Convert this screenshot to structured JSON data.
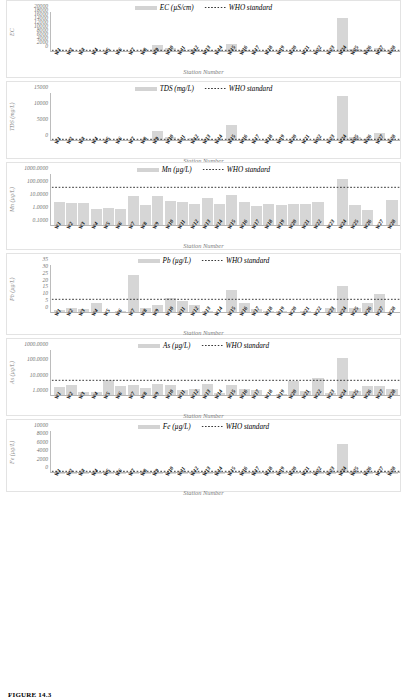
{
  "figure": {
    "caption": "FIGURE 14.3",
    "x_axis_title": "Station Number",
    "stations": [
      "W1",
      "W2",
      "W3",
      "W4",
      "W5",
      "W6",
      "W7",
      "W8",
      "W9",
      "W10",
      "W11",
      "W12",
      "W13",
      "W14",
      "W15",
      "W16",
      "W17",
      "W18",
      "W19",
      "W20",
      "W21",
      "W22",
      "W23",
      "W24",
      "W25",
      "W26",
      "W27",
      "W28"
    ],
    "who_legend_label": "WHO standard",
    "colors": {
      "bar": "#d6d6d6",
      "who_line": "#3b3b3b",
      "axis": "#bcbcbc",
      "label": "#6f6f6f"
    }
  },
  "chart_data": [
    {
      "type": "bar",
      "id": "ec",
      "title": "",
      "series_label": "EC (µS/cm)",
      "ylabel": "EC",
      "xlabel": "Station Number",
      "scale": "linear",
      "ylim": [
        0,
        20000
      ],
      "yticks": [
        0,
        2000,
        4000,
        6000,
        8000,
        10000,
        12000,
        14000,
        16000,
        18000,
        20000
      ],
      "ytick_labels": [
        "0",
        "2000",
        "4000",
        "6000",
        "8000",
        "10000",
        "12000",
        "14000",
        "16000",
        "18000",
        "20000"
      ],
      "who_standard": 1000,
      "categories": [
        "W1",
        "W2",
        "W3",
        "W4",
        "W5",
        "W6",
        "W7",
        "W8",
        "W9",
        "W10",
        "W11",
        "W12",
        "W13",
        "W14",
        "W15",
        "W16",
        "W17",
        "W18",
        "W19",
        "W20",
        "W21",
        "W22",
        "W23",
        "W24",
        "W25",
        "W26",
        "W27",
        "W28"
      ],
      "values": [
        420,
        390,
        350,
        430,
        300,
        310,
        360,
        480,
        3600,
        1900,
        700,
        1450,
        780,
        600,
        3950,
        900,
        600,
        680,
        640,
        520,
        600,
        700,
        520,
        16800,
        1700,
        800,
        2000,
        560
      ]
    },
    {
      "type": "bar",
      "id": "tds",
      "series_label": "TDS (mg/L)",
      "ylabel": "TDS (mg/L)",
      "xlabel": "Station Number",
      "scale": "linear",
      "ylim": [
        0,
        15000
      ],
      "yticks": [
        0,
        5000,
        10000,
        15000
      ],
      "ytick_labels": [
        "0",
        "5000",
        "10000",
        "15000"
      ],
      "who_standard": 500,
      "categories": [
        "W1",
        "W2",
        "W3",
        "W4",
        "W5",
        "W6",
        "W7",
        "W8",
        "W9",
        "W10",
        "W11",
        "W12",
        "W13",
        "W14",
        "W15",
        "W16",
        "W17",
        "W18",
        "W19",
        "W20",
        "W21",
        "W22",
        "W23",
        "W24",
        "W25",
        "W26",
        "W27",
        "W28"
      ],
      "values": [
        260,
        240,
        220,
        270,
        190,
        200,
        230,
        300,
        3000,
        1200,
        440,
        900,
        490,
        380,
        5000,
        560,
        380,
        430,
        400,
        330,
        380,
        440,
        330,
        14000,
        1100,
        500,
        2500,
        350
      ]
    },
    {
      "type": "bar",
      "id": "mn",
      "series_label": "Mn (µg/L)",
      "ylabel": "Mn (µg/L)",
      "xlabel": "Station Number",
      "scale": "log",
      "ylim": [
        0.1,
        1000
      ],
      "yticks": [
        0.1,
        1,
        10,
        100,
        1000
      ],
      "ytick_labels": [
        "0.1000",
        "1.0000",
        "10.0000",
        "100.0000",
        "1000.0000"
      ],
      "who_standard": 100,
      "categories": [
        "W1",
        "W2",
        "W3",
        "W4",
        "W5",
        "W6",
        "W7",
        "W8",
        "W9",
        "W10",
        "W11",
        "W12",
        "W13",
        "W14",
        "W15",
        "W16",
        "W17",
        "W18",
        "W19",
        "W20",
        "W21",
        "W22",
        "W23",
        "W24",
        "W25",
        "W26",
        "W27",
        "W28"
      ],
      "values": [
        7.0,
        6.0,
        5.5,
        2.2,
        2.6,
        2.1,
        22.0,
        4.5,
        20.0,
        9.0,
        6.5,
        5.2,
        15.0,
        5.0,
        23.0,
        7.5,
        3.2,
        4.6,
        4.3,
        5.0,
        5.0,
        7.0,
        0.0,
        380.0,
        4.5,
        1.6,
        0.0,
        10.0
      ]
    },
    {
      "type": "bar",
      "id": "pb",
      "series_label": "Pb (µg/L)",
      "ylabel": "Pb (µg/L)",
      "xlabel": "Station Number",
      "scale": "linear",
      "ylim": [
        0,
        35
      ],
      "yticks": [
        0,
        5,
        10,
        15,
        20,
        25,
        30,
        35
      ],
      "ytick_labels": [
        "0",
        "5",
        "10",
        "15",
        "20",
        "25",
        "30",
        "35"
      ],
      "who_standard": 10,
      "categories": [
        "W1",
        "W2",
        "W3",
        "W4",
        "W5",
        "W6",
        "W7",
        "W8",
        "W9",
        "W10",
        "W11",
        "W12",
        "W13",
        "W14",
        "W15",
        "W16",
        "W17",
        "W18",
        "W19",
        "W20",
        "W21",
        "W22",
        "W23",
        "W24",
        "W25",
        "W26",
        "W27",
        "W28"
      ],
      "values": [
        2.0,
        4.0,
        3.0,
        7.0,
        0.4,
        1.5,
        28.0,
        3.5,
        6.0,
        11.0,
        8.5,
        6.0,
        1.2,
        1.0,
        16.5,
        7.5,
        3.0,
        1.5,
        1.2,
        1.0,
        1.5,
        1.0,
        4.0,
        20.0,
        4.0,
        7.5,
        14.0,
        1.0
      ]
    },
    {
      "type": "bar",
      "id": "as",
      "series_label": "As (µg/L)",
      "ylabel": "As (µg/L)",
      "xlabel": "Station Number",
      "scale": "log",
      "ylim": [
        1,
        1000
      ],
      "yticks": [
        1,
        10,
        100,
        1000
      ],
      "ytick_labels": [
        "1.0000",
        "10.0000",
        "100.0000",
        "1000.0000"
      ],
      "who_standard": 10,
      "categories": [
        "W1",
        "W2",
        "W3",
        "W4",
        "W5",
        "W6",
        "W7",
        "W8",
        "W9",
        "W10",
        "W11",
        "W12",
        "W13",
        "W14",
        "W15",
        "W16",
        "W17",
        "W18",
        "W19",
        "W20",
        "W21",
        "W22",
        "W23",
        "W24",
        "W25",
        "W26",
        "W27",
        "W28"
      ],
      "values": [
        4.0,
        5.5,
        1.8,
        1.7,
        11.0,
        4.5,
        5.5,
        3.2,
        6.5,
        5.0,
        2.4,
        2.8,
        6.0,
        1.6,
        5.0,
        3.0,
        2.5,
        1.0,
        1.3,
        9.0,
        2.2,
        14.0,
        1.5,
        300.0,
        2.0,
        4.5,
        4.5,
        3.0
      ]
    },
    {
      "type": "bar",
      "id": "fe",
      "series_label": "Fe (µg/L)",
      "ylabel": "Fe (µg/L)",
      "xlabel": "Station Number",
      "scale": "linear",
      "ylim": [
        0,
        10000
      ],
      "yticks": [
        0,
        2000,
        4000,
        6000,
        8000,
        10000
      ],
      "ytick_labels": [
        "0",
        "2000",
        "4000",
        "6000",
        "8000",
        "10000"
      ],
      "who_standard": 300,
      "categories": [
        "W1",
        "W2",
        "W3",
        "W4",
        "W5",
        "W6",
        "W7",
        "W8",
        "W9",
        "W10",
        "W11",
        "W12",
        "W13",
        "W14",
        "W15",
        "W16",
        "W17",
        "W18",
        "W19",
        "W20",
        "W21",
        "W22",
        "W23",
        "W24",
        "W25",
        "W26",
        "W27",
        "W28"
      ],
      "values": [
        60,
        70,
        55,
        80,
        40,
        45,
        90,
        60,
        120,
        100,
        70,
        85,
        75,
        60,
        150,
        90,
        60,
        70,
        65,
        55,
        70,
        80,
        60,
        7000,
        110,
        70,
        260,
        50
      ]
    }
  ]
}
